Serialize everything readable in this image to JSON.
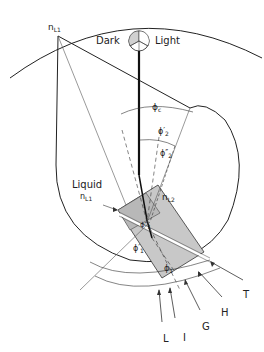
{
  "labels": {
    "n_l1_top": {
      "main": "n",
      "sub": "L1"
    },
    "dark": "Dark",
    "light": "Light",
    "phi_c": {
      "main": "ϕ",
      "sub": "c"
    },
    "phi2_prime": {
      "main": "ϕ′",
      "sub": "2"
    },
    "phi2_dprime": {
      "main": "ϕ″",
      "sub": "2"
    },
    "liquid": "Liquid",
    "n_l1_liquid": {
      "main": "n",
      "sub": "L1"
    },
    "n_l2": {
      "main": "n",
      "sub": "L2"
    },
    "phi1_dprime": {
      "main": "ϕ″",
      "sub": "1"
    },
    "phi1_prime": {
      "main": "ϕ′",
      "sub": "1"
    },
    "phi1": {
      "main": "ϕ",
      "sub": "1"
    },
    "rays": [
      "L",
      "I",
      "G",
      "H",
      "T"
    ]
  },
  "colors": {
    "line": "#222222",
    "prism_fill": "#c8c8c8",
    "indicator_fill": "#d0d0d0"
  }
}
